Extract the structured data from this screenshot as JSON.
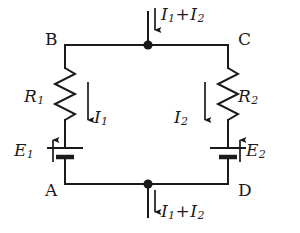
{
  "figure": {
    "type": "electrical-circuit-diagram",
    "stroke_color": "#1a1a1a",
    "background_color": "#ffffff"
  },
  "nodes": {
    "top_left": "B",
    "top_right": "C",
    "bottom_left": "A",
    "bottom_right": "D",
    "top_junction_name": "top-junction-dot",
    "bottom_junction_name": "bottom-junction-dot"
  },
  "components": {
    "resistor_left": {
      "symbol": "R",
      "subscript": "1",
      "type": "resistor"
    },
    "resistor_right": {
      "symbol": "R",
      "subscript": "2",
      "type": "resistor"
    },
    "battery_left": {
      "symbol": "E",
      "subscript": "1",
      "type": "battery",
      "emf_arrow_direction": "up"
    },
    "battery_right": {
      "symbol": "E",
      "subscript": "2",
      "type": "battery",
      "emf_arrow_direction": "up"
    }
  },
  "currents": {
    "left_branch": {
      "symbol": "I",
      "subscript": "1",
      "arrow_direction": "down"
    },
    "right_branch": {
      "symbol": "I",
      "subscript": "2",
      "arrow_direction": "down"
    },
    "top_lead": {
      "first_symbol": "I",
      "first_subscript": "1",
      "operator": "+",
      "second_symbol": "I",
      "second_subscript": "2",
      "arrow_direction": "down"
    },
    "bottom_lead": {
      "first_symbol": "I",
      "first_subscript": "1",
      "operator": "+",
      "second_symbol": "I",
      "second_subscript": "2",
      "arrow_direction": "down"
    }
  }
}
